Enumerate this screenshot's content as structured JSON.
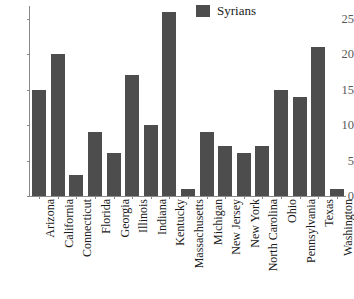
{
  "chart_data": {
    "type": "bar",
    "title": "",
    "xlabel": "",
    "ylabel": "",
    "categories": [
      "Arizona",
      "California",
      "Connecticut",
      "Florida",
      "Georgia",
      "Illinois",
      "Indiana",
      "Kentucky",
      "Massachusetts",
      "Michigan",
      "New Jersey",
      "New York",
      "North Carolina",
      "Ohio",
      "Pennsylvania",
      "Texas",
      "Washington"
    ],
    "series": [
      {
        "name": "Syrians",
        "color": "#4d4d4d",
        "values": [
          15,
          20,
          3,
          9,
          6,
          17,
          10,
          26,
          1,
          9,
          7,
          6,
          7,
          15,
          14,
          21,
          1
        ]
      }
    ],
    "ylim": [
      0,
      26.5
    ],
    "yticks": [
      0,
      5,
      10,
      15,
      20,
      25
    ],
    "ytick_labels": [
      "0",
      "5",
      "10",
      "15",
      "20",
      "25"
    ],
    "grid": false,
    "legend": {
      "position": "top-right",
      "entries": [
        {
          "label": "Syrians",
          "color": "#4d4d4d"
        }
      ]
    },
    "axis_color": "#8a8a8a",
    "background": "#ffffff"
  }
}
